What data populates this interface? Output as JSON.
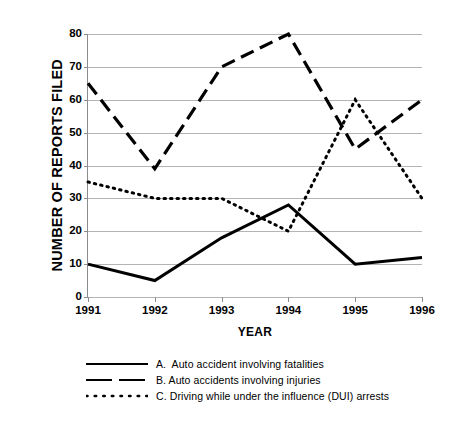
{
  "chart_data": {
    "type": "line",
    "title": "",
    "xlabel": "YEAR",
    "ylabel": "NUMBER OF REPORTS FILED",
    "categories": [
      "1991",
      "1992",
      "1993",
      "1994",
      "1995",
      "1996"
    ],
    "x": [
      1991,
      1992,
      1993,
      1994,
      1995,
      1996
    ],
    "ylim": [
      0,
      80
    ],
    "yticks": [
      0,
      10,
      20,
      30,
      40,
      50,
      60,
      70,
      80
    ],
    "ytick_labels": [
      "0",
      "10",
      "20",
      "30",
      "40",
      "50",
      "60",
      "70",
      "80"
    ],
    "grid": "horizontal",
    "legend_position": "below",
    "series": [
      {
        "key": "A",
        "name": "A.  Auto accident involving fatalities",
        "style": "solid",
        "color": "#000000",
        "values": [
          10,
          5,
          18,
          28,
          10,
          12
        ]
      },
      {
        "key": "B",
        "name": "B. Auto accidents involving injuries",
        "style": "dashed",
        "color": "#000000",
        "values": [
          65,
          39,
          70,
          80,
          45,
          60
        ]
      },
      {
        "key": "C",
        "name": "C. Driving while under the influence (DUI) arrests",
        "style": "dotted",
        "color": "#000000",
        "values": [
          35,
          30,
          30,
          20,
          60,
          30
        ]
      }
    ]
  },
  "axes": {
    "y_title": "NUMBER OF REPORTS FILED",
    "x_title": "YEAR",
    "y_labels": [
      "80",
      "70",
      "60",
      "50",
      "40",
      "30",
      "20",
      "10",
      "0"
    ],
    "x_labels": [
      "1991",
      "1992",
      "1993",
      "1994",
      "1995",
      "1996"
    ]
  },
  "legend": {
    "items": [
      {
        "sample": "solid-line-sample",
        "label": "A.  Auto accident involving fatalities"
      },
      {
        "sample": "dashed-line-sample",
        "label": "B. Auto accidents involving injuries"
      },
      {
        "sample": "dotted-line-sample",
        "label": "C. Driving while under the influence (DUI) arrests"
      }
    ]
  },
  "colors": {
    "background": "#ffffff",
    "ink": "#000000",
    "grid": "#b4b4b4",
    "axis": "#8c8c8c"
  }
}
